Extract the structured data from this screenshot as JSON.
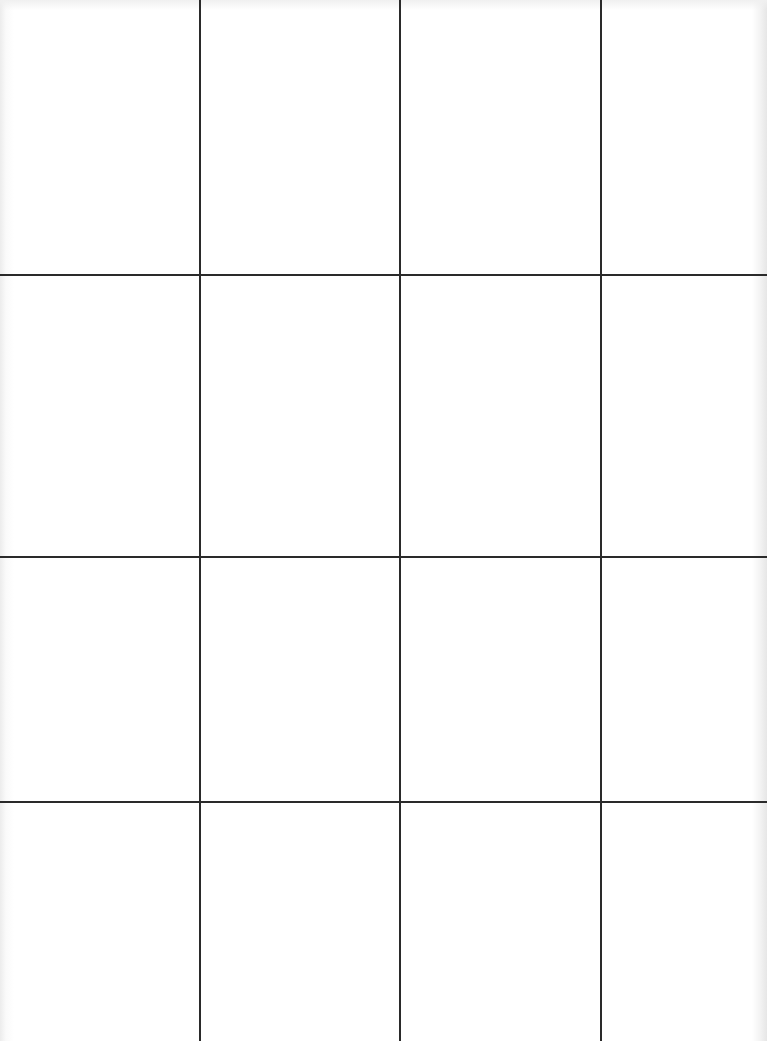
{
  "page": {
    "type": "blank grid sheet",
    "background_color": "#ffffff",
    "line_color": "#2a2a2a"
  },
  "grid": {
    "columns": 4,
    "rows": 4,
    "vertical_lines_x": [
      200,
      400,
      601
    ],
    "horizontal_lines_y": [
      275,
      557,
      802
    ],
    "cells": [
      [
        "",
        "",
        "",
        ""
      ],
      [
        "",
        "",
        "",
        ""
      ],
      [
        "",
        "",
        "",
        ""
      ],
      [
        "",
        "",
        "",
        ""
      ]
    ]
  }
}
